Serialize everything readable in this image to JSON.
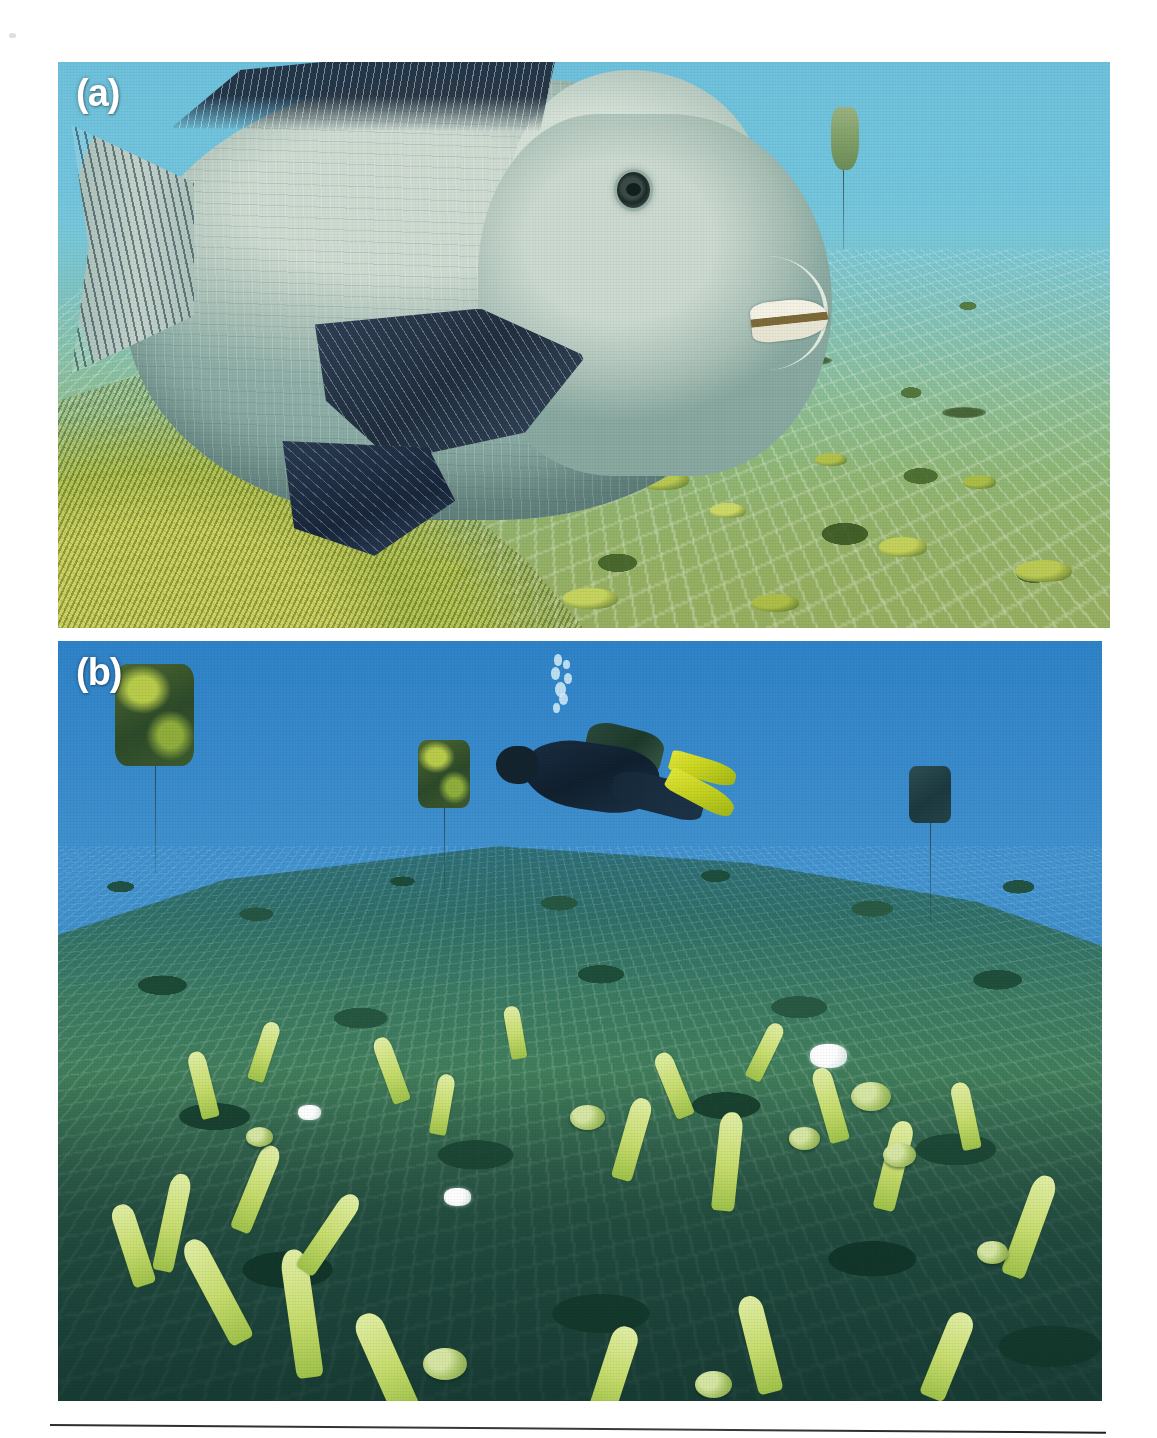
{
  "figure": {
    "panels": [
      {
        "id": "a",
        "label": "(a)",
        "scene": "bumphead-parrotfish-over-netted-reef",
        "water_color": "#74c4dd",
        "substrate_color": "#9ab84f",
        "subjects": [
          "bumphead parrotfish",
          "plastic mesh net over reef flat",
          "coral recruits",
          "algal-covered reef ridge",
          "marker buoy with tether"
        ]
      },
      {
        "id": "b",
        "label": "(b)",
        "scene": "scuba-diver-surveying-netted-reef-plot",
        "water_color": "#3e8fcd",
        "substrate_color": "#3b7a63",
        "subjects": [
          "scuba diver with tank and yellow fins",
          "exhaled bubble stream",
          "three tethered marker buoys",
          "mesh net covering reef plot",
          "branching Acropora coral colonies",
          "massive coral nodules",
          "bleached coral fragment"
        ]
      }
    ],
    "rule": {
      "present": true,
      "color": "#2d2d2d"
    },
    "artifacts": {
      "scan_speck": true
    }
  },
  "panel_a": {
    "label": "(a)",
    "coral_heads": [
      {
        "left": "42%",
        "top": "64%",
        "w": "4.2%",
        "h": "3.0%",
        "color": "#c8d45e"
      },
      {
        "left": "55%",
        "top": "72%",
        "w": "5.0%",
        "h": "3.6%",
        "color": "#b9c953"
      },
      {
        "left": "62%",
        "top": "78%",
        "w": "3.4%",
        "h": "2.6%",
        "color": "#cdd968"
      },
      {
        "left": "72%",
        "top": "69%",
        "w": "3.0%",
        "h": "2.4%",
        "color": "#b2c24c"
      },
      {
        "left": "78%",
        "top": "84%",
        "w": "4.6%",
        "h": "3.4%",
        "color": "#c4d25b"
      },
      {
        "left": "86%",
        "top": "73%",
        "w": "3.2%",
        "h": "2.4%",
        "color": "#aabd47"
      },
      {
        "left": "91%",
        "top": "88%",
        "w": "5.4%",
        "h": "3.8%",
        "color": "#bccb55"
      },
      {
        "left": "33%",
        "top": "88%",
        "w": "6.0%",
        "h": "4.2%",
        "color": "#b8c751"
      },
      {
        "left": "48%",
        "top": "93%",
        "w": "5.2%",
        "h": "3.6%",
        "color": "#c6d45f"
      },
      {
        "left": "66%",
        "top": "94%",
        "w": "4.4%",
        "h": "3.2%",
        "color": "#aebf49"
      }
    ],
    "dark_patches": [
      {
        "left": "25%",
        "top": "60%",
        "w": "5%",
        "h": "2.2%"
      },
      {
        "left": "37%",
        "top": "55%",
        "w": "4%",
        "h": "1.8%"
      },
      {
        "left": "58%",
        "top": "58%",
        "w": "4.6%",
        "h": "2.0%"
      },
      {
        "left": "70%",
        "top": "52%",
        "w": "3.6%",
        "h": "1.6%"
      },
      {
        "left": "84%",
        "top": "61%",
        "w": "4.2%",
        "h": "1.9%"
      }
    ]
  },
  "panel_b": {
    "label": "(b)",
    "buoys": [
      {
        "name": "buoy-left-algal",
        "left": "5.5%",
        "top": "3.0%",
        "w": "7.5%",
        "h": "13.5%",
        "algal": true,
        "tether_h": "14%"
      },
      {
        "name": "buoy-mid-algal",
        "left": "34.5%",
        "top": "13.0%",
        "w": "5.0%",
        "h": "9.0%",
        "algal": true,
        "tether_h": "11%"
      },
      {
        "name": "buoy-right-dark",
        "left": "81.5%",
        "top": "16.5%",
        "w": "4.0%",
        "h": "7.5%",
        "algal": false,
        "tether_h": "13%"
      }
    ],
    "bubbles": [
      {
        "left": "40%",
        "top": "2%",
        "d": "16%"
      },
      {
        "left": "58%",
        "top": "10%",
        "d": "13%"
      },
      {
        "left": "34%",
        "top": "20%",
        "d": "18%"
      },
      {
        "left": "60%",
        "top": "28%",
        "d": "15%"
      },
      {
        "left": "42%",
        "top": "40%",
        "d": "22%"
      },
      {
        "left": "50%",
        "top": "56%",
        "d": "17%"
      },
      {
        "left": "38%",
        "top": "70%",
        "d": "13%"
      }
    ],
    "branches": [
      {
        "left": "6%",
        "top": "74%",
        "w": "2.2%",
        "h": "11%",
        "rot": "-18deg"
      },
      {
        "left": "10%",
        "top": "70%",
        "w": "2.0%",
        "h": "13%",
        "rot": "12deg"
      },
      {
        "left": "14%",
        "top": "78%",
        "w": "2.4%",
        "h": "15%",
        "rot": "-28deg"
      },
      {
        "left": "18%",
        "top": "66%",
        "w": "2.0%",
        "h": "12%",
        "rot": "22deg"
      },
      {
        "left": "22%",
        "top": "80%",
        "w": "2.6%",
        "h": "17%",
        "rot": "-8deg"
      },
      {
        "left": "25%",
        "top": "72%",
        "w": "2.0%",
        "h": "12%",
        "rot": "34deg"
      },
      {
        "left": "13%",
        "top": "54%",
        "w": "1.7%",
        "h": "9%",
        "rot": "-14deg"
      },
      {
        "left": "19%",
        "top": "50%",
        "w": "1.6%",
        "h": "8%",
        "rot": "18deg"
      },
      {
        "left": "31%",
        "top": "52%",
        "w": "1.7%",
        "h": "9%",
        "rot": "-20deg"
      },
      {
        "left": "36%",
        "top": "57%",
        "w": "1.6%",
        "h": "8%",
        "rot": "10deg"
      },
      {
        "left": "43%",
        "top": "48%",
        "w": "1.5%",
        "h": "7%",
        "rot": "-10deg"
      },
      {
        "left": "54%",
        "top": "60%",
        "w": "2.0%",
        "h": "11%",
        "rot": "16deg"
      },
      {
        "left": "58%",
        "top": "54%",
        "w": "1.8%",
        "h": "9%",
        "rot": "-22deg"
      },
      {
        "left": "63%",
        "top": "62%",
        "w": "2.2%",
        "h": "13%",
        "rot": "6deg"
      },
      {
        "left": "67%",
        "top": "50%",
        "w": "1.6%",
        "h": "8%",
        "rot": "26deg"
      },
      {
        "left": "73%",
        "top": "56%",
        "w": "1.9%",
        "h": "10%",
        "rot": "-16deg"
      },
      {
        "left": "79%",
        "top": "63%",
        "w": "2.1%",
        "h": "12%",
        "rot": "14deg"
      },
      {
        "left": "86%",
        "top": "58%",
        "w": "1.8%",
        "h": "9%",
        "rot": "-12deg"
      },
      {
        "left": "92%",
        "top": "70%",
        "w": "2.3%",
        "h": "14%",
        "rot": "20deg"
      },
      {
        "left": "30%",
        "top": "88%",
        "w": "2.8%",
        "h": "14%",
        "rot": "-24deg"
      },
      {
        "left": "52%",
        "top": "90%",
        "w": "2.6%",
        "h": "12%",
        "rot": "18deg"
      },
      {
        "left": "66%",
        "top": "86%",
        "w": "2.4%",
        "h": "13%",
        "rot": "-14deg"
      },
      {
        "left": "84%",
        "top": "88%",
        "w": "2.5%",
        "h": "12%",
        "rot": "22deg"
      }
    ],
    "nodules": [
      {
        "left": "49%",
        "top": "61%",
        "d": "3.4%"
      },
      {
        "left": "70%",
        "top": "64%",
        "d": "3.0%"
      },
      {
        "left": "76%",
        "top": "58%",
        "d": "3.8%"
      },
      {
        "left": "79%",
        "top": "66%",
        "d": "3.2%"
      },
      {
        "left": "18%",
        "top": "64%",
        "d": "2.6%"
      },
      {
        "left": "35%",
        "top": "93%",
        "d": "4.2%"
      },
      {
        "left": "61%",
        "top": "96%",
        "d": "3.6%"
      },
      {
        "left": "88%",
        "top": "79%",
        "d": "3.0%"
      }
    ],
    "bleached": [
      {
        "left": "72%",
        "top": "53%",
        "w": "3.6%",
        "h": "3.2%"
      },
      {
        "left": "37%",
        "top": "72%",
        "w": "2.6%",
        "h": "2.4%"
      },
      {
        "left": "23%",
        "top": "61%",
        "w": "2.2%",
        "h": "2.0%"
      }
    ]
  }
}
